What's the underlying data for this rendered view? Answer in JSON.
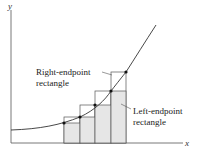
{
  "axes": {
    "x_label": "x",
    "y_label": "y"
  },
  "labels": {
    "right_line1": "Right-endpoint",
    "right_line2": "rectangle",
    "left_line1": "Left-endpoint",
    "left_line2": "rectangle"
  },
  "colors": {
    "line": "#333333",
    "fill": "#e6e6e6",
    "background": "#ffffff"
  }
}
